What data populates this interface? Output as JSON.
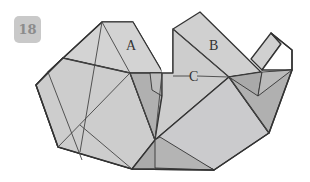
{
  "step": {
    "number": "18"
  },
  "labels": {
    "a": "A",
    "b": "B",
    "c": "C"
  },
  "colors": {
    "paper_light": "#cfcfcf",
    "paper_mid": "#b9b9b9",
    "paper_dark": "#a6a6a6",
    "line": "#333333",
    "badge_bg": "#c9c9c9",
    "badge_text": "#8c8c8c"
  }
}
